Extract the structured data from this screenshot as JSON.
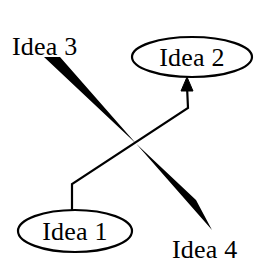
{
  "diagram": {
    "background_color": "#ffffff",
    "stroke_color": "#000000",
    "width": 260,
    "height": 267,
    "nodes": [
      {
        "id": "idea1",
        "label": "Idea 1",
        "shape": "ellipse",
        "cx": 75,
        "cy": 231,
        "rx": 57,
        "ry": 21,
        "text_x": 75,
        "text_y": 240
      },
      {
        "id": "idea2",
        "label": "Idea 2",
        "shape": "ellipse",
        "cx": 192,
        "cy": 57,
        "rx": 60,
        "ry": 20,
        "text_x": 192,
        "text_y": 66
      },
      {
        "id": "idea3",
        "label": "Idea 3",
        "shape": "plain-text",
        "text_x": 12,
        "text_y": 55
      },
      {
        "id": "idea4",
        "label": "Idea 4",
        "shape": "plain-text",
        "text_x": 172,
        "text_y": 258
      }
    ],
    "edges": [
      {
        "id": "edge-idea1-to-idea2",
        "from": "idea1",
        "to": "idea2",
        "style": "thin-line",
        "arrow": "end",
        "points": "72,211 72,184 188,108 187,86",
        "arrow_head": "187,77 181,91 193,91"
      },
      {
        "id": "edge-idea3-to-idea4",
        "from": "idea3",
        "to": "idea4",
        "style": "solid-wedge",
        "arrow": "none",
        "polygon": "44,57 60,57 212,230 196,200"
      }
    ]
  }
}
